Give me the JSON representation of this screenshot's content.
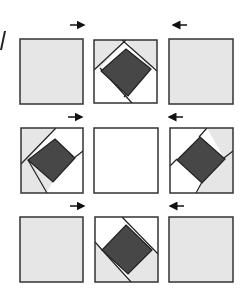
{
  "figure": {
    "label_fragment": "A",
    "colors": {
      "light_gray": "#e6e6e6",
      "white": "#ffffff",
      "dark": "#474747",
      "stroke": "#333333",
      "arrow": "#111111"
    },
    "arrows": [
      {
        "row": 0,
        "direction": "right"
      },
      {
        "row": 0,
        "direction": "left"
      },
      {
        "row": 1,
        "direction": "right"
      },
      {
        "row": 1,
        "direction": "left"
      },
      {
        "row": 2,
        "direction": "right"
      },
      {
        "row": 2,
        "direction": "left"
      }
    ],
    "grid": [
      [
        {
          "type": "plain-gray"
        },
        {
          "type": "diamond",
          "gray_side": "top"
        },
        {
          "type": "plain-gray"
        }
      ],
      [
        {
          "type": "diamond",
          "gray_side": "left"
        },
        {
          "type": "plain-white"
        },
        {
          "type": "diamond",
          "gray_side": "right"
        }
      ],
      [
        {
          "type": "plain-gray"
        },
        {
          "type": "diamond",
          "gray_side": "bottom"
        },
        {
          "type": "plain-gray"
        }
      ]
    ]
  }
}
